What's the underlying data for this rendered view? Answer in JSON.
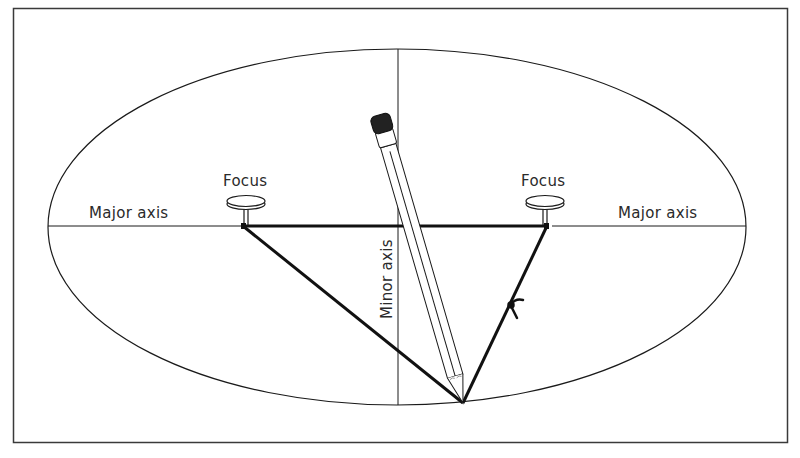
{
  "figure": {
    "labels": {
      "focus_left": "Focus",
      "focus_right": "Focus",
      "major_axis_left": "Major axis",
      "major_axis_right": "Major axis",
      "minor_axis": "Minor axis"
    },
    "colors": {
      "ink": "#1a1a1a",
      "background": "#ffffff",
      "pencil_eraser": "#222222"
    }
  }
}
